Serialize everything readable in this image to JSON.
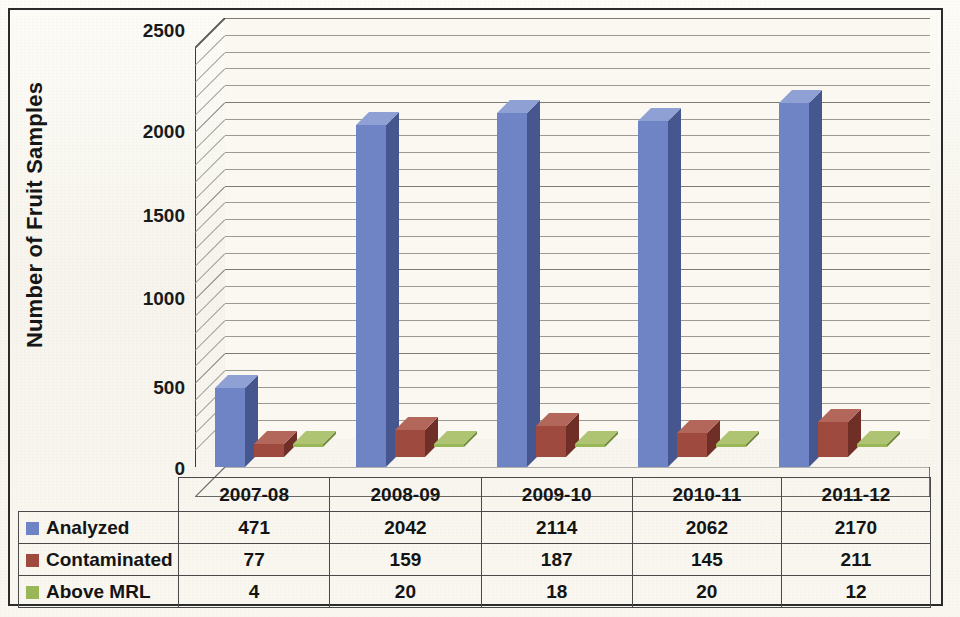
{
  "chart_data": {
    "type": "bar",
    "title": "",
    "subtitle": "",
    "xlabel": "",
    "ylabel": "Number of Fruit Samples",
    "categories": [
      "2007-08",
      "2008-09",
      "2009-10",
      "2010-11",
      "2011-12"
    ],
    "series": [
      {
        "name": "Analyzed",
        "values": [
          471,
          2042,
          2114,
          2062,
          2170
        ],
        "color": "#6f84c4"
      },
      {
        "name": "Contaminated",
        "values": [
          77,
          159,
          187,
          145,
          211
        ],
        "color": "#9e4a3e"
      },
      {
        "name": "Above MRL",
        "values": [
          4,
          20,
          18,
          20,
          12
        ],
        "color": "#9ab758"
      }
    ],
    "ylim": [
      0,
      2500
    ],
    "yticks": [
      0,
      500,
      1000,
      1500,
      2000,
      2500
    ],
    "ytick_labels": [
      "0",
      "500",
      "1000",
      "1500",
      "2000",
      "2500"
    ],
    "minor_tick_step": 100,
    "grid": true,
    "legend_position": "data-table-row-headers",
    "style": "3d-clustered-column",
    "data_table_visible": true
  },
  "axis": {
    "y_title": "Number of Fruit Samples",
    "y_labels": [
      "2500",
      "2000",
      "1500",
      "1000",
      "500",
      "0"
    ]
  },
  "table": {
    "column_headers": [
      "2007-08",
      "2008-09",
      "2009-10",
      "2010-11",
      "2011-12"
    ],
    "rows": [
      {
        "label": "Analyzed",
        "swatch_color": "#6f84c4",
        "values": [
          "471",
          "2042",
          "2114",
          "2062",
          "2170"
        ]
      },
      {
        "label": "Contaminated",
        "swatch_color": "#9e4a3e",
        "values": [
          "77",
          "159",
          "187",
          "145",
          "211"
        ]
      },
      {
        "label": "Above MRL",
        "swatch_color": "#9ab758",
        "values": [
          "4",
          "20",
          "18",
          "20",
          "12"
        ]
      }
    ]
  },
  "colors": {
    "analyzed_front": "#6f84c4",
    "analyzed_side": "#46568f",
    "analyzed_top": "#8ea0d4",
    "contaminated_front": "#9e4a3e",
    "contaminated_side": "#6f2f27",
    "contaminated_top": "#b3675a",
    "above_mrl_front": "#9ab758",
    "above_mrl_side": "#728a3c",
    "above_mrl_top": "#aec473",
    "paper": "#faf8f1",
    "gridline": "#9b9b93",
    "frame": "#2b2b2b",
    "text": "#141414"
  }
}
